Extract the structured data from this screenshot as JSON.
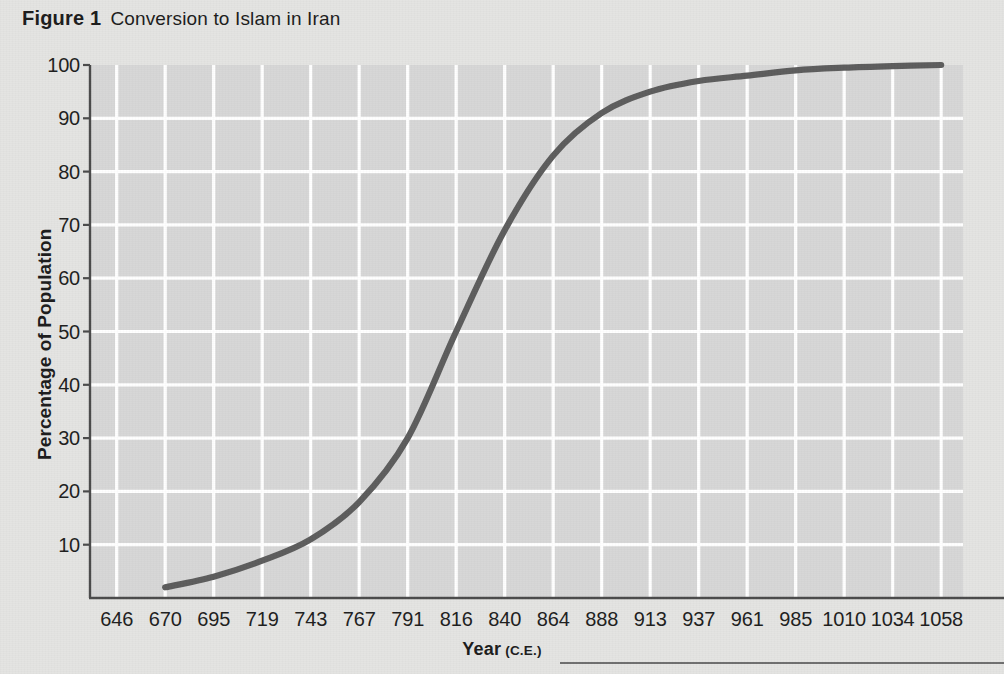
{
  "caption": {
    "label": "Figure 1",
    "title": "Conversion to Islam in Iran"
  },
  "colors": {
    "page_background": "#e4e4e2",
    "plot_background": "#d7d7d7",
    "gridline": "#ffffff",
    "axis_line": "#4b4b4b",
    "curve": "#5d5d5d",
    "text": "#1c1c1c",
    "rule": "#6f6f6f"
  },
  "axes": {
    "y_title": "Percentage of Population",
    "x_title_main": "Year",
    "x_title_sub": "(C.E.)",
    "y_ticks": [
      10,
      20,
      30,
      40,
      50,
      60,
      70,
      80,
      90,
      100
    ],
    "x_ticks": [
      646,
      670,
      695,
      719,
      743,
      767,
      791,
      816,
      840,
      864,
      888,
      913,
      937,
      961,
      985,
      1010,
      1034,
      1058
    ]
  },
  "chart_data": {
    "type": "line",
    "title": "Conversion to Islam in Iran",
    "xlabel": "Year (C.E.)",
    "ylabel": "Percentage of Population",
    "xlim": [
      646,
      1058
    ],
    "ylim": [
      0,
      100
    ],
    "grid": true,
    "legend": "none",
    "x": [
      670,
      695,
      719,
      743,
      767,
      791,
      816,
      840,
      864,
      888,
      913,
      937,
      961,
      985,
      1010,
      1034,
      1058
    ],
    "values": [
      2,
      4,
      7,
      11,
      18,
      30,
      50,
      69,
      83,
      91,
      95,
      97,
      98,
      99,
      99.5,
      99.8,
      100
    ],
    "series": [
      {
        "name": "Converted population",
        "values": [
          2,
          4,
          7,
          11,
          18,
          30,
          50,
          69,
          83,
          91,
          95,
          97,
          98,
          99,
          99.5,
          99.8,
          100
        ]
      }
    ]
  }
}
